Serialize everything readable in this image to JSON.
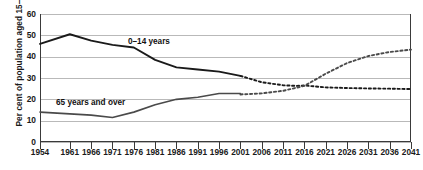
{
  "chart_data": {
    "type": "line",
    "title": "",
    "xlabel": "",
    "ylabel": "Per cent of population aged 15–64 years",
    "ylim": [
      0,
      60
    ],
    "yticks": [
      0,
      10,
      20,
      30,
      40,
      50,
      60
    ],
    "xlim": [
      1954,
      2041
    ],
    "xticks": [
      1954,
      1961,
      1966,
      1971,
      1976,
      1981,
      1986,
      1991,
      1996,
      2001,
      2006,
      2011,
      2016,
      2021,
      2026,
      2031,
      2036,
      2041
    ],
    "grid": true,
    "legend_position": "inline-annotations",
    "annotations": [
      "0–14 years",
      "65 years and over"
    ],
    "series": [
      {
        "name": "0–14 years",
        "style": "solid-then-dotted",
        "color": "#1a1a1a",
        "actual": {
          "x": [
            1954,
            1961,
            1966,
            1971,
            1976,
            1981,
            1986,
            1991,
            1996,
            2001
          ],
          "y": [
            46.0,
            50.5,
            47.5,
            45.5,
            44.3,
            38.5,
            35.0,
            34.0,
            33.0,
            31.0
          ]
        },
        "projected": {
          "x": [
            2001,
            2006,
            2011,
            2014,
            2016,
            2021,
            2026,
            2031,
            2036,
            2041
          ],
          "y": [
            31.0,
            28.0,
            26.6,
            26.3,
            26.5,
            25.6,
            25.3,
            25.1,
            25.0,
            24.8
          ]
        }
      },
      {
        "name": "65 years and over",
        "style": "solid-then-dotted",
        "color": "#4a4a4a",
        "actual": {
          "x": [
            1954,
            1961,
            1966,
            1971,
            1976,
            1981,
            1986,
            1991,
            1996,
            2001
          ],
          "y": [
            14.0,
            13.2,
            12.6,
            11.5,
            14.0,
            17.5,
            20.0,
            21.0,
            22.7,
            22.7
          ]
        },
        "projected": {
          "x": [
            2001,
            2006,
            2011,
            2016,
            2021,
            2026,
            2031,
            2036,
            2041
          ],
          "y": [
            22.3,
            22.8,
            24.0,
            26.3,
            32.0,
            37.0,
            40.3,
            42.2,
            43.3
          ]
        }
      }
    ]
  },
  "axis": {
    "y_label": "Per cent of population aged 15–64 years",
    "y_ticks": [
      "0",
      "10",
      "20",
      "30",
      "40",
      "50",
      "60"
    ],
    "x_ticks": [
      "1954",
      "1961",
      "1966",
      "1971",
      "1976",
      "1981",
      "1986",
      "1991",
      "1996",
      "2001",
      "2006",
      "2011",
      "2016",
      "2021",
      "2026",
      "2031",
      "2036",
      "2041"
    ]
  },
  "labels": {
    "young": "0–14 years",
    "old": "65 years and over"
  },
  "colors": {
    "young_line": "#1a1a1a",
    "old_line": "#4a4a4a",
    "grid": "#b9b9b9",
    "axis": "#3a3a3a",
    "text": "#1a1a1a",
    "background": "#ffffff"
  }
}
